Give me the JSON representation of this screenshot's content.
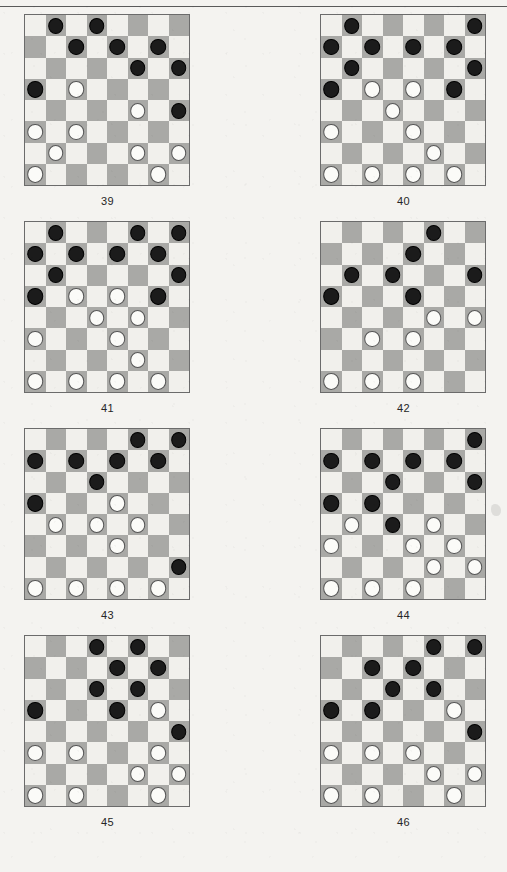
{
  "page": {
    "board_size": 8,
    "colors": {
      "light_square": "#f1f0ec",
      "dark_square": "#a9a9a6",
      "black_piece": "#1b1b1b",
      "white_piece": "#fbfbf8",
      "board_border": "#6b6b6b",
      "paper": "#f4f3f0",
      "caption_text": "#262626"
    }
  },
  "diagrams": [
    {
      "number": "39",
      "pieces": [
        {
          "row": 0,
          "col": 1,
          "color": "black"
        },
        {
          "row": 0,
          "col": 3,
          "color": "black"
        },
        {
          "row": 1,
          "col": 2,
          "color": "black"
        },
        {
          "row": 1,
          "col": 4,
          "color": "black"
        },
        {
          "row": 1,
          "col": 6,
          "color": "black"
        },
        {
          "row": 2,
          "col": 5,
          "color": "black"
        },
        {
          "row": 2,
          "col": 7,
          "color": "black"
        },
        {
          "row": 3,
          "col": 0,
          "color": "black"
        },
        {
          "row": 3,
          "col": 2,
          "color": "white"
        },
        {
          "row": 4,
          "col": 5,
          "color": "white"
        },
        {
          "row": 4,
          "col": 7,
          "color": "black"
        },
        {
          "row": 5,
          "col": 0,
          "color": "white"
        },
        {
          "row": 5,
          "col": 2,
          "color": "white"
        },
        {
          "row": 6,
          "col": 1,
          "color": "white"
        },
        {
          "row": 6,
          "col": 5,
          "color": "white"
        },
        {
          "row": 6,
          "col": 7,
          "color": "white"
        },
        {
          "row": 7,
          "col": 0,
          "color": "white"
        },
        {
          "row": 7,
          "col": 6,
          "color": "white"
        }
      ]
    },
    {
      "number": "40",
      "pieces": [
        {
          "row": 0,
          "col": 1,
          "color": "black"
        },
        {
          "row": 0,
          "col": 7,
          "color": "black"
        },
        {
          "row": 1,
          "col": 0,
          "color": "black"
        },
        {
          "row": 1,
          "col": 2,
          "color": "black"
        },
        {
          "row": 1,
          "col": 4,
          "color": "black"
        },
        {
          "row": 1,
          "col": 6,
          "color": "black"
        },
        {
          "row": 2,
          "col": 1,
          "color": "black"
        },
        {
          "row": 2,
          "col": 7,
          "color": "black"
        },
        {
          "row": 3,
          "col": 0,
          "color": "black"
        },
        {
          "row": 3,
          "col": 2,
          "color": "white"
        },
        {
          "row": 3,
          "col": 4,
          "color": "white"
        },
        {
          "row": 3,
          "col": 6,
          "color": "black"
        },
        {
          "row": 4,
          "col": 3,
          "color": "white"
        },
        {
          "row": 5,
          "col": 0,
          "color": "white"
        },
        {
          "row": 5,
          "col": 4,
          "color": "white"
        },
        {
          "row": 6,
          "col": 5,
          "color": "white"
        },
        {
          "row": 7,
          "col": 0,
          "color": "white"
        },
        {
          "row": 7,
          "col": 2,
          "color": "white"
        },
        {
          "row": 7,
          "col": 4,
          "color": "white"
        },
        {
          "row": 7,
          "col": 6,
          "color": "white"
        }
      ]
    },
    {
      "number": "41",
      "pieces": [
        {
          "row": 0,
          "col": 1,
          "color": "black"
        },
        {
          "row": 0,
          "col": 5,
          "color": "black"
        },
        {
          "row": 0,
          "col": 7,
          "color": "black"
        },
        {
          "row": 1,
          "col": 0,
          "color": "black"
        },
        {
          "row": 1,
          "col": 2,
          "color": "black"
        },
        {
          "row": 1,
          "col": 4,
          "color": "black"
        },
        {
          "row": 1,
          "col": 6,
          "color": "black"
        },
        {
          "row": 2,
          "col": 1,
          "color": "black"
        },
        {
          "row": 2,
          "col": 7,
          "color": "black"
        },
        {
          "row": 3,
          "col": 0,
          "color": "black"
        },
        {
          "row": 3,
          "col": 2,
          "color": "white"
        },
        {
          "row": 3,
          "col": 4,
          "color": "white"
        },
        {
          "row": 3,
          "col": 6,
          "color": "black"
        },
        {
          "row": 4,
          "col": 3,
          "color": "white"
        },
        {
          "row": 4,
          "col": 5,
          "color": "white"
        },
        {
          "row": 5,
          "col": 0,
          "color": "white"
        },
        {
          "row": 5,
          "col": 4,
          "color": "white"
        },
        {
          "row": 6,
          "col": 5,
          "color": "white"
        },
        {
          "row": 7,
          "col": 0,
          "color": "white"
        },
        {
          "row": 7,
          "col": 2,
          "color": "white"
        },
        {
          "row": 7,
          "col": 4,
          "color": "white"
        },
        {
          "row": 7,
          "col": 6,
          "color": "white"
        }
      ]
    },
    {
      "number": "42",
      "pieces": [
        {
          "row": 0,
          "col": 5,
          "color": "black"
        },
        {
          "row": 1,
          "col": 4,
          "color": "black"
        },
        {
          "row": 2,
          "col": 1,
          "color": "black"
        },
        {
          "row": 2,
          "col": 3,
          "color": "black"
        },
        {
          "row": 2,
          "col": 7,
          "color": "black"
        },
        {
          "row": 3,
          "col": 0,
          "color": "black"
        },
        {
          "row": 3,
          "col": 4,
          "color": "black"
        },
        {
          "row": 4,
          "col": 5,
          "color": "white"
        },
        {
          "row": 4,
          "col": 7,
          "color": "white"
        },
        {
          "row": 5,
          "col": 2,
          "color": "white"
        },
        {
          "row": 5,
          "col": 4,
          "color": "white"
        },
        {
          "row": 7,
          "col": 0,
          "color": "white"
        },
        {
          "row": 7,
          "col": 2,
          "color": "white"
        },
        {
          "row": 7,
          "col": 4,
          "color": "white"
        }
      ]
    },
    {
      "number": "43",
      "pieces": [
        {
          "row": 0,
          "col": 5,
          "color": "black"
        },
        {
          "row": 0,
          "col": 7,
          "color": "black"
        },
        {
          "row": 1,
          "col": 0,
          "color": "black"
        },
        {
          "row": 1,
          "col": 2,
          "color": "black"
        },
        {
          "row": 1,
          "col": 4,
          "color": "black"
        },
        {
          "row": 1,
          "col": 6,
          "color": "black"
        },
        {
          "row": 2,
          "col": 3,
          "color": "black"
        },
        {
          "row": 3,
          "col": 0,
          "color": "black"
        },
        {
          "row": 3,
          "col": 4,
          "color": "white"
        },
        {
          "row": 4,
          "col": 1,
          "color": "white"
        },
        {
          "row": 4,
          "col": 3,
          "color": "white"
        },
        {
          "row": 4,
          "col": 5,
          "color": "white"
        },
        {
          "row": 5,
          "col": 4,
          "color": "white"
        },
        {
          "row": 6,
          "col": 7,
          "color": "black"
        },
        {
          "row": 7,
          "col": 0,
          "color": "white"
        },
        {
          "row": 7,
          "col": 2,
          "color": "white"
        },
        {
          "row": 7,
          "col": 4,
          "color": "white"
        },
        {
          "row": 7,
          "col": 6,
          "color": "white"
        }
      ]
    },
    {
      "number": "44",
      "pieces": [
        {
          "row": 0,
          "col": 7,
          "color": "black"
        },
        {
          "row": 1,
          "col": 0,
          "color": "black"
        },
        {
          "row": 1,
          "col": 2,
          "color": "black"
        },
        {
          "row": 1,
          "col": 4,
          "color": "black"
        },
        {
          "row": 1,
          "col": 6,
          "color": "black"
        },
        {
          "row": 2,
          "col": 3,
          "color": "black"
        },
        {
          "row": 2,
          "col": 7,
          "color": "black"
        },
        {
          "row": 3,
          "col": 0,
          "color": "black"
        },
        {
          "row": 3,
          "col": 2,
          "color": "black"
        },
        {
          "row": 4,
          "col": 1,
          "color": "white"
        },
        {
          "row": 4,
          "col": 3,
          "color": "black"
        },
        {
          "row": 4,
          "col": 5,
          "color": "white"
        },
        {
          "row": 5,
          "col": 0,
          "color": "white"
        },
        {
          "row": 5,
          "col": 4,
          "color": "white"
        },
        {
          "row": 5,
          "col": 6,
          "color": "white"
        },
        {
          "row": 6,
          "col": 5,
          "color": "white"
        },
        {
          "row": 6,
          "col": 7,
          "color": "white"
        },
        {
          "row": 7,
          "col": 0,
          "color": "white"
        },
        {
          "row": 7,
          "col": 2,
          "color": "white"
        },
        {
          "row": 7,
          "col": 4,
          "color": "white"
        }
      ]
    },
    {
      "number": "45",
      "pieces": [
        {
          "row": 0,
          "col": 3,
          "color": "black"
        },
        {
          "row": 0,
          "col": 5,
          "color": "black"
        },
        {
          "row": 1,
          "col": 4,
          "color": "black"
        },
        {
          "row": 1,
          "col": 6,
          "color": "black"
        },
        {
          "row": 2,
          "col": 3,
          "color": "black"
        },
        {
          "row": 2,
          "col": 5,
          "color": "black"
        },
        {
          "row": 3,
          "col": 0,
          "color": "black"
        },
        {
          "row": 3,
          "col": 4,
          "color": "black"
        },
        {
          "row": 3,
          "col": 6,
          "color": "white"
        },
        {
          "row": 4,
          "col": 7,
          "color": "black"
        },
        {
          "row": 5,
          "col": 0,
          "color": "white"
        },
        {
          "row": 5,
          "col": 2,
          "color": "white"
        },
        {
          "row": 5,
          "col": 6,
          "color": "white"
        },
        {
          "row": 6,
          "col": 5,
          "color": "white"
        },
        {
          "row": 6,
          "col": 7,
          "color": "white"
        },
        {
          "row": 7,
          "col": 0,
          "color": "white"
        },
        {
          "row": 7,
          "col": 2,
          "color": "white"
        },
        {
          "row": 7,
          "col": 6,
          "color": "white"
        }
      ]
    },
    {
      "number": "46",
      "pieces": [
        {
          "row": 0,
          "col": 5,
          "color": "black"
        },
        {
          "row": 0,
          "col": 7,
          "color": "black"
        },
        {
          "row": 1,
          "col": 2,
          "color": "black"
        },
        {
          "row": 1,
          "col": 4,
          "color": "black"
        },
        {
          "row": 2,
          "col": 3,
          "color": "black"
        },
        {
          "row": 2,
          "col": 5,
          "color": "black"
        },
        {
          "row": 3,
          "col": 0,
          "color": "black"
        },
        {
          "row": 3,
          "col": 2,
          "color": "black"
        },
        {
          "row": 3,
          "col": 6,
          "color": "white"
        },
        {
          "row": 4,
          "col": 7,
          "color": "black"
        },
        {
          "row": 5,
          "col": 0,
          "color": "white"
        },
        {
          "row": 5,
          "col": 2,
          "color": "white"
        },
        {
          "row": 5,
          "col": 4,
          "color": "white"
        },
        {
          "row": 6,
          "col": 5,
          "color": "white"
        },
        {
          "row": 6,
          "col": 7,
          "color": "white"
        },
        {
          "row": 7,
          "col": 0,
          "color": "white"
        },
        {
          "row": 7,
          "col": 2,
          "color": "white"
        },
        {
          "row": 7,
          "col": 6,
          "color": "white"
        }
      ]
    }
  ]
}
